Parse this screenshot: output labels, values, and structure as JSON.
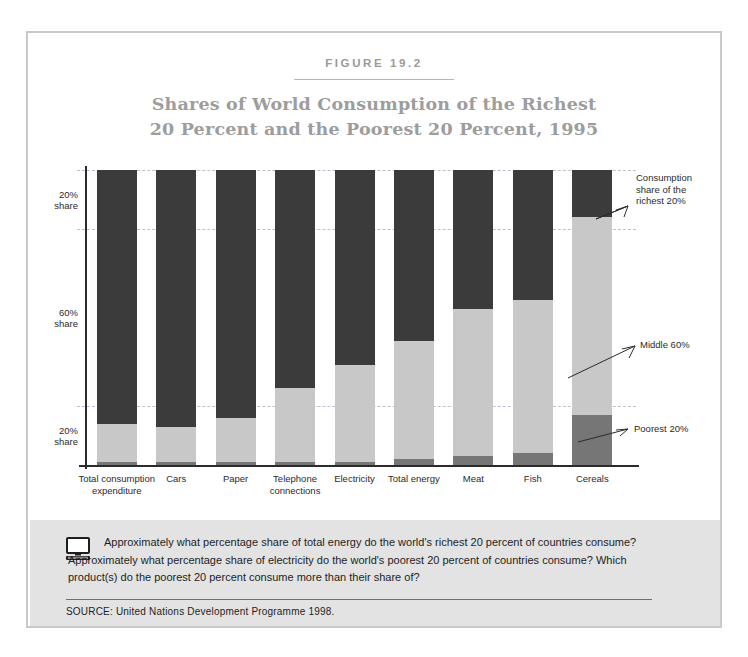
{
  "figure": {
    "label": "FIGURE 19.2",
    "title_line1": "Shares of World Consumption of the Richest",
    "title_line2": "20 Percent and the Poorest 20 Percent, 1995"
  },
  "colors": {
    "richest": "#3b3b3b",
    "middle": "#c8c8c8",
    "poorest": "#767676",
    "gridline": "#b9c4d0",
    "axis": "#2b2b2b",
    "title": "#9d9d9d",
    "panel_bg": "#e3e3e3",
    "frame": "#c9c9c9"
  },
  "axis": {
    "y_labels": [
      {
        "line1": "20%",
        "line2": "share"
      },
      {
        "line1": "60%",
        "line2": "share"
      },
      {
        "line1": "20%",
        "line2": "share"
      }
    ]
  },
  "callouts": {
    "richest": "Consumption share of the richest 20%",
    "middle": "Middle 60%",
    "poorest": "Poorest 20%"
  },
  "question": {
    "text": "Approximately what percentage share of total energy do the world's richest 20 percent of countries consume? Approximately what percentage share of electricity do the world's poorest 20 percent of countries consume? Which product(s) do the poorest 20 percent consume more than their share of?",
    "icon": "computer-monitor-icon"
  },
  "source": "SOURCE:  United Nations Development Programme 1998.",
  "chart_data": {
    "type": "bar",
    "stacked": true,
    "title": "Shares of World Consumption of the Richest 20 Percent and the Poorest 20 Percent, 1995",
    "xlabel": "",
    "ylabel": "",
    "ylim": [
      0,
      100
    ],
    "grid": true,
    "gridlines": [
      20,
      80,
      100
    ],
    "legend_position": "right-callouts",
    "categories": [
      "Total consumption expenditure",
      "Cars",
      "Paper",
      "Telephone connections",
      "Electricity",
      "Total energy",
      "Meat",
      "Fish",
      "Cereals"
    ],
    "series": [
      {
        "name": "Consumption share of the richest 20%",
        "values": [
          86,
          87,
          84,
          74,
          66,
          58,
          47,
          44,
          16
        ]
      },
      {
        "name": "Middle 60%",
        "values": [
          13,
          12,
          15,
          25,
          33,
          40,
          50,
          52,
          67
        ]
      },
      {
        "name": "Poorest 20%",
        "values": [
          1,
          1,
          1,
          1,
          1,
          2,
          3,
          4,
          17
        ]
      }
    ]
  }
}
